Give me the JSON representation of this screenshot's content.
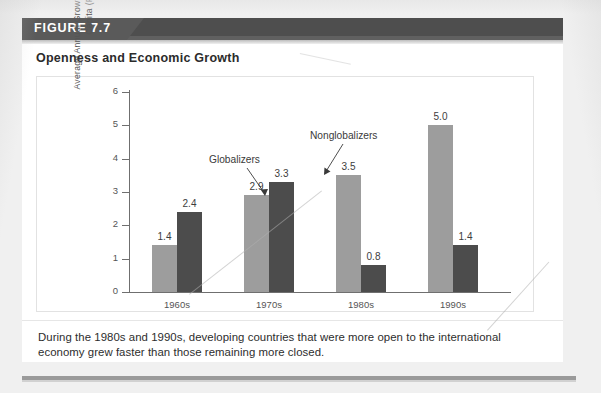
{
  "figure": {
    "tag": "FIGURE 7.7",
    "title": "Openness and Economic Growth",
    "caption": "During the 1980s and 1990s, developing countries that were more open to the international economy grew faster than those remaining more closed."
  },
  "colors": {
    "header_band": "#4e4e4e",
    "figure_tag": "#5a5a5a",
    "globalizers": "#9d9d9d",
    "nonglobalizers": "#4c4c4c",
    "axis": "#6f6f6f",
    "panel": "#ffffff",
    "page": "#f0f0f0"
  },
  "chart_data": {
    "type": "bar",
    "title": "Openness and Economic Growth",
    "xlabel": "",
    "ylabel": "Average Annual Growth in Real Income per Capita (Percent)",
    "categories": [
      "1960s",
      "1970s",
      "1980s",
      "1990s"
    ],
    "series": [
      {
        "name": "Globalizers",
        "color": "#9d9d9d",
        "values": [
          1.4,
          2.9,
          3.5,
          5.0
        ]
      },
      {
        "name": "Nonglobalizers",
        "color": "#4c4c4c",
        "values": [
          2.4,
          3.3,
          0.8,
          1.4
        ]
      }
    ],
    "ylim": [
      0,
      6
    ],
    "yticks": [
      0,
      1,
      2,
      3,
      4,
      5,
      6
    ],
    "ytick_labels": [
      "0",
      "1",
      "2",
      "3",
      "4",
      "5",
      "6"
    ],
    "grid": false,
    "legend": "none",
    "annotations": [
      {
        "text": "Globalizers",
        "points_to": "1970s globalizers bar"
      },
      {
        "text": "Nonglobalizers",
        "points_to": "1970s nonglobalizers bar"
      }
    ],
    "data_labels": [
      "1.4",
      "2.4",
      "2.9",
      "3.3",
      "3.5",
      "0.8",
      "5.0",
      "1.4"
    ]
  }
}
